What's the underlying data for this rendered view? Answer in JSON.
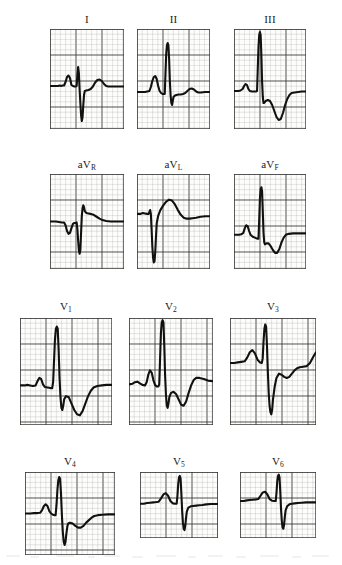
{
  "figure": {
    "type": "ecg-12-lead",
    "rows": 4,
    "columns": 3,
    "background_color": "#ffffff",
    "trace_color": "#111111",
    "grid_minor_color": "#9a9a9a",
    "grid_major_color": "#3a3a3a",
    "paper_color": "#fdfdfb"
  },
  "leads": [
    {
      "id": "I",
      "label": "I",
      "label_base": "I",
      "label_sub": "",
      "row": 1,
      "column": 1,
      "box": {
        "x": 50,
        "y": 29,
        "w": 74,
        "h": 100
      },
      "label_y": 13,
      "grid": {
        "minor": 5.2,
        "major_every": 5
      },
      "baseline_pct": 57,
      "morphology": "small r, deep S, upright T",
      "path": "M0,57 L11,57 L13,56.5 L15,57 L17,56.5 L19,56.5 L21,53 L23,48 L25,46.5 L27,49 L29,56 L31,57 L33,57.5 L35,57.5 L36,57 L37,46 L38,38 L39,44 L40,60 L41,74 L42,86 L43,92 L44,88 L45,76 L46,66 L47,62 L49,61.5 L52,61 L55,60 L58,57.5 L61,53.5 L64,51 L67,50.5 L70,52 L73,55 L76,57 L79,57.5 L83,57.5 L88,57.5 L94,57.5 L100,57.5 L100,57.5"
    },
    {
      "id": "II",
      "label": "II",
      "label_base": "II",
      "label_sub": "",
      "row": 1,
      "column": 2,
      "box": {
        "x": 137,
        "y": 29,
        "w": 73,
        "h": 100
      },
      "label_y": 13,
      "grid": {
        "minor": 5.2,
        "major_every": 5
      },
      "baseline_pct": 63,
      "morphology": "prominent P, tall R, S, upright T",
      "path": "M0,63 L8,63 L11,63 L14,62.5 L17,62 L19,58 L21,52 L23,48 L25,47 L27,50 L29,57 L31,62 L33,64 L35,65 L37,65 L38,65 L39,45 L40,25 L41,16 L42,14 L43,16 L44,30 L45,52 L46,66 L47,74 L48,76 L49,72 L50,68 L52,66.5 L54,66 L57,65.5 L60,65.5 L63,65 L66,64 L69,62 L72,60 L75,59.5 L78,60.5 L81,62.5 L84,63.5 L88,63.5 L93,63 L100,63"
    },
    {
      "id": "III",
      "label": "III",
      "label_base": "III",
      "label_sub": "",
      "row": 1,
      "column": 3,
      "box": {
        "x": 234,
        "y": 29,
        "w": 72,
        "h": 100
      },
      "label_y": 13,
      "grid": {
        "minor": 5.2,
        "major_every": 5
      },
      "baseline_pct": 62,
      "morphology": "very tall R spike, deep inverted T",
      "path": "M0,62 L6,62 L9,61.5 L12,60 L14,57 L16,55 L18,56 L20,60 L22,62 L25,62.5 L28,62.5 L31,62.5 L32,62 L33,40 L34,18 L35,6 L36,3 L37,6 L38,26 L39,52 L40,68 L41,74 L42,74 L44,72 L47,71 L50,72 L53,76 L56,82 L59,88 L62,91 L65,90 L68,84 L71,76 L74,70 L77,66 L80,64 L84,63.5 L89,63 L94,62.5 L100,62.5"
    },
    {
      "id": "aVR",
      "label": "aVR",
      "label_base": "aV",
      "label_sub": "R",
      "row": 2,
      "column": 1,
      "box": {
        "x": 50,
        "y": 174,
        "w": 74,
        "h": 95
      },
      "label_y": 158,
      "grid": {
        "minor": 5.2,
        "major_every": 5
      },
      "baseline_pct": 50,
      "morphology": "inverted P, deep QS, small terminal R",
      "path": "M0,50 L8,50 L12,50.5 L16,51 L19,51 L21,54 L23,60 L25,63 L27,62 L29,57 L31,52.5 L33,51.5 L35,51.5 L36,51 L37,58 L38,70 L39,80 L40,84 L41,80 L42,62 L43,44 L44,36 L45,33 L46,35 L47,39 L49,41 L52,41.5 L55,42 L59,43 L63,45 L67,47 L71,48.5 L76,49.5 L82,50 L90,50 L100,50"
    },
    {
      "id": "aVL",
      "label": "aVL",
      "label_base": "aV",
      "label_sub": "L",
      "row": 2,
      "column": 2,
      "box": {
        "x": 137,
        "y": 174,
        "w": 73,
        "h": 95
      },
      "label_y": 158,
      "grid": {
        "minor": 5.2,
        "major_every": 5
      },
      "baseline_pct": 42,
      "morphology": "very deep QS, broad upright T",
      "path": "M0,42 L5,42 L8,41 L11,41.5 L14,42 L16,42 L17,40 L18,38 L19,42 L20,58 L21,76 L22,88 L23,93 L24,92 L25,82 L26,66 L27,52 L29,44 L32,38 L36,33 L40,29 L44,27 L48,28 L52,32 L56,38 L60,43 L64,46 L68,47 L72,47 L76,46.5 L81,46 L87,45 L94,44.5 L100,44.5"
    },
    {
      "id": "aVF",
      "label": "aVF",
      "label_base": "aV",
      "label_sub": "F",
      "row": 2,
      "column": 3,
      "box": {
        "x": 234,
        "y": 174,
        "w": 72,
        "h": 95
      },
      "label_y": 158,
      "grid": {
        "minor": 5.2,
        "major_every": 5
      },
      "baseline_pct": 64,
      "morphology": "P wave, tall R spike, inverted T",
      "path": "M0,64 L7,64 L10,63.5 L13,62 L15,57 L17,54 L19,55 L21,60 L23,64 L26,66 L29,67 L32,68 L34,68 L35,48 L36,26 L37,16 L38,14 L39,18 L40,40 L41,62 L42,72 L43,74 L45,73 L48,73 L51,76 L54,80 L57,83 L60,83 L63,79 L66,72 L69,67 L72,64 L76,63 L82,62.5 L90,62.5 L100,62.5"
    },
    {
      "id": "V1",
      "label": "V1",
      "label_base": "V",
      "label_sub": "1",
      "row": 3,
      "column": 1,
      "box": {
        "x": 20,
        "y": 318,
        "w": 92,
        "h": 107
      },
      "label_y": 300,
      "grid": {
        "minor": 5.2,
        "major_every": 5
      },
      "baseline_pct": 63,
      "morphology": "tall narrow R, deep S, inverted T",
      "path": "M0,63 L5,63 L8,62.5 L11,63 L14,63.5 L17,63 L19,59 L21,56 L23,57 L25,62 L27,64.5 L30,65 L33,65.5 L35,65.5 L36,60 L37,40 L38,20 L39,10 L40,8 L41,10 L42,30 L43,56 L44,74 L45,84 L46,86 L47,82 L48,76 L50,73 L53,74 L56,80 L59,86 L62,90 L65,91 L68,87 L71,80 L74,73 L77,68 L80,65 L84,63.5 L89,63 L94,62.5 L100,62.5"
    },
    {
      "id": "V2",
      "label": "V2",
      "label_base": "V",
      "label_sub": "2",
      "row": 3,
      "column": 2,
      "box": {
        "x": 129,
        "y": 318,
        "w": 84,
        "h": 107
      },
      "label_y": 300,
      "grid": {
        "minor": 5.2,
        "major_every": 5
      },
      "baseline_pct": 62,
      "morphology": "P wave, very tall R, deep S, biphasic T",
      "path": "M0,62 L4,61.5 L7,60 L10,59.5 L13,61 L16,62.5 L19,63 L21,60 L23,53 L25,49 L27,51 L29,58 L31,62.5 L33,64 L35,64 L36,62 L37,38 L38,14 L39,4 L40,2 L41,4 L42,26 L43,54 L44,72 L45,82 L46,84 L47,80 L48,74 L50,70 L53,69 L56,71 L59,76 L62,81 L65,82 L68,78 L71,70 L74,63 L77,58 L80,56 L84,56 L89,57 L94,58.5 L100,59"
    },
    {
      "id": "V3",
      "label": "V3",
      "label_base": "V",
      "label_sub": "3",
      "row": 3,
      "column": 3,
      "box": {
        "x": 230,
        "y": 318,
        "w": 86,
        "h": 107
      },
      "label_y": 300,
      "grid": {
        "minor": 5.2,
        "major_every": 5
      },
      "baseline_pct": 42,
      "morphology": "tall R, deep S below baseline, rising ST",
      "path": "M0,42 L5,42 L9,41.5 L13,41 L17,40.5 L20,37 L23,32 L26,30 L29,33 L32,39 L35,41.5 L37,42 L38,38 L39,22 L40,10 L41,6 L42,8 L43,26 L44,50 L45,70 L46,82 L47,88 L48,90 L49,86 L50,76 L52,64 L54,56 L57,52 L60,53 L63,55 L66,56 L69,55 L72,52 L75,49 L78,47 L81,46 L85,45.5 L89,45 L93,42 L97,36 L100,32"
    },
    {
      "id": "V4",
      "label": "V4",
      "label_base": "V",
      "label_sub": "4",
      "row": 4,
      "column": 1,
      "box": {
        "x": 25,
        "y": 472,
        "w": 90,
        "h": 83
      },
      "label_y": 455,
      "grid": {
        "minor": 5.2,
        "major_every": 5
      },
      "baseline_pct": 50,
      "morphology": "tall R, deep S, small T",
      "path": "M0,50 L6,50 L10,49.5 L14,49.5 L17,49 L19,46 L21,41 L23,39 L25,41 L27,47 L29,50 L31,51.5 L33,52 L34,52 L35,40 L36,22 L37,10 L38,6 L39,8 L40,26 L41,52 L42,72 L43,84 L44,88 L45,84 L46,74 L47,66 L48,62 L50,61 L53,62 L56,65 L59,67 L62,67 L65,65 L68,61 L71,58 L74,55 L77,53 L81,52 L86,51.5 L92,51 L100,51"
    },
    {
      "id": "V5",
      "label": "V5",
      "label_base": "V",
      "label_sub": "5",
      "row": 4,
      "column": 2,
      "box": {
        "x": 140,
        "y": 472,
        "w": 78,
        "h": 66
      },
      "label_y": 455,
      "grid": {
        "minor": 5.2,
        "major_every": 5
      },
      "baseline_pct": 48,
      "morphology": "P wave, tall R, deep narrow S, flat T",
      "path": "M0,48 L5,48 L9,47 L13,46.5 L17,46 L21,45.5 L24,45 L27,40 L30,34 L33,32 L36,36 L39,44 L42,47.5 L45,48 L47,48 L48,36 L49,18 L50,8 L51,6 L52,10 L53,32 L54,58 L55,76 L56,86 L57,88 L58,82 L59,70 L60,60 L62,54 L65,52 L68,51.5 L72,51 L76,50.5 L80,50 L85,49 L91,48.5 L100,48.5"
    },
    {
      "id": "V6",
      "label": "V6",
      "label_base": "V",
      "label_sub": "6",
      "row": 4,
      "column": 3,
      "box": {
        "x": 240,
        "y": 472,
        "w": 76,
        "h": 66
      },
      "label_y": 455,
      "grid": {
        "minor": 5.2,
        "major_every": 5
      },
      "baseline_pct": 44,
      "morphology": "small P, tall R, deep S, flat T",
      "path": "M0,44 L5,44 L9,43 L13,42.5 L17,42 L21,41.5 L24,41 L27,36 L30,31 L33,30 L36,34 L39,41 L42,43.5 L45,44 L47,44 L48,32 L49,14 L50,6 L51,4 L52,8 L53,30 L54,56 L55,74 L56,84 L57,86 L58,80 L59,68 L60,58 L62,52 L65,49 L68,48 L72,47.5 L76,47 L81,46.5 L87,46 L94,46 L100,46"
    }
  ]
}
